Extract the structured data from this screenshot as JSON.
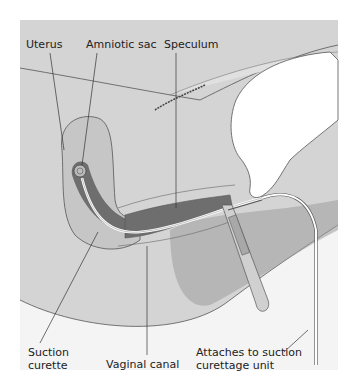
{
  "labels": {
    "uterus": "Uterus",
    "amniotic_sac": "Amniotic sac",
    "speculum": "Speculum",
    "suction_curette_line1": "Suction",
    "suction_curette_line2": "curette",
    "vaginal_canal": "Vaginal canal",
    "attaches_line1": "Attaches to suction",
    "attaches_line2": "curettage unit"
  },
  "colors": {
    "panel": "#d4d4d4",
    "background": "#ffffff",
    "tissue_light": "#c6c6c6",
    "tissue_dark": "#6e6e6e",
    "outline": "#555555",
    "hand": "#ffffff",
    "leader": "#333333"
  }
}
